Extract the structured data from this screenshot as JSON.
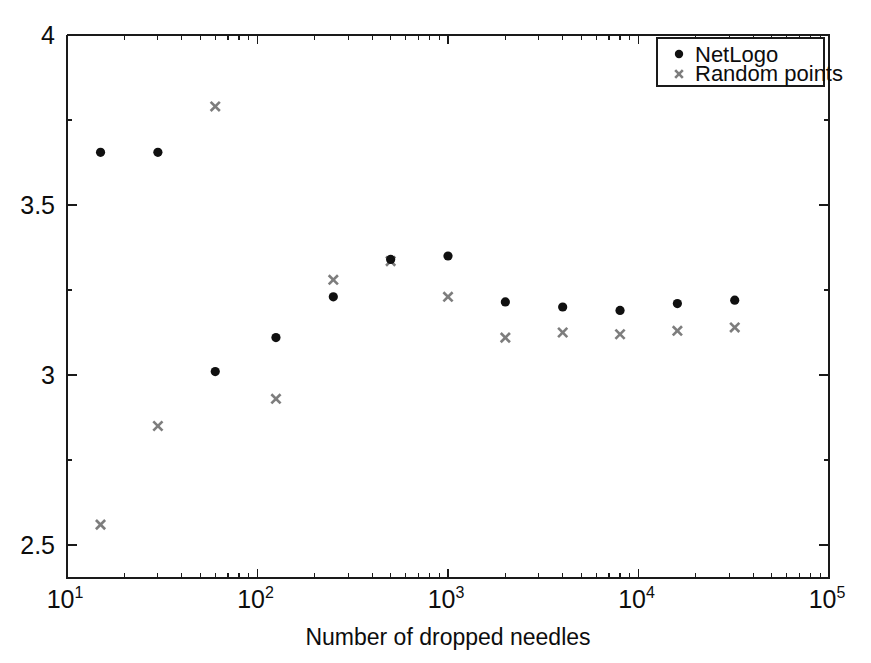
{
  "chart_data": {
    "type": "scatter",
    "title": "",
    "subtitle": "",
    "xlabel": "Number of dropped needles",
    "ylabel": "",
    "xscale": "log",
    "yscale": "linear",
    "xlim": [
      10,
      100000
    ],
    "ylim": [
      2.403,
      4.0
    ],
    "grid": false,
    "legend_position": "top-right",
    "x_tick_labels": [
      "10^1",
      "10^2",
      "10^3",
      "10^4",
      "10^5"
    ],
    "x_tick_values": [
      10,
      100,
      1000,
      10000,
      100000
    ],
    "y_tick_labels": [
      "2.5",
      "3",
      "3.5",
      "4"
    ],
    "y_tick_values": [
      2.5,
      3,
      3.5,
      4
    ],
    "series": [
      {
        "name": "NetLogo",
        "marker": "filled-circle",
        "color": "#101010",
        "x": [
          15,
          30,
          125,
          250,
          500,
          1000,
          2000,
          4000,
          8000,
          16000,
          32000
        ],
        "y": [
          3.655,
          3.655,
          3.11,
          3.23,
          3.34,
          3.35,
          3.215,
          3.2,
          3.19,
          3.21,
          3.22
        ]
      },
      {
        "name": "Random points",
        "marker": "cross",
        "color": "#7d7d7d",
        "x": [
          15,
          30,
          60,
          125,
          250,
          500,
          1000,
          2000,
          4000,
          8000,
          16000,
          32000
        ],
        "y": [
          2.56,
          2.85,
          3.79,
          2.93,
          3.28,
          3.335,
          3.23,
          3.11,
          3.125,
          3.12,
          3.13,
          3.14
        ]
      }
    ],
    "extra_points": [
      {
        "series": "NetLogo",
        "x": 60,
        "y": 3.01
      }
    ]
  },
  "legend": {
    "entries": [
      {
        "label": "NetLogo",
        "marker": "filled-circle",
        "color": "#101010"
      },
      {
        "label": "Random points",
        "marker": "cross",
        "color": "#7d7d7d"
      }
    ]
  },
  "axes": {
    "x_title": "Number of dropped needles",
    "x_labels": [
      {
        "base": "10",
        "exp": "1"
      },
      {
        "base": "10",
        "exp": "2"
      },
      {
        "base": "10",
        "exp": "3"
      },
      {
        "base": "10",
        "exp": "4"
      },
      {
        "base": "10",
        "exp": "5"
      }
    ],
    "y_labels": [
      "4",
      "3.5",
      "3",
      "2.5"
    ]
  },
  "colors": {
    "axis": "#1a1a1a",
    "netlogo": "#101010",
    "random_points": "#7d7d7d",
    "background": "#ffffff"
  }
}
